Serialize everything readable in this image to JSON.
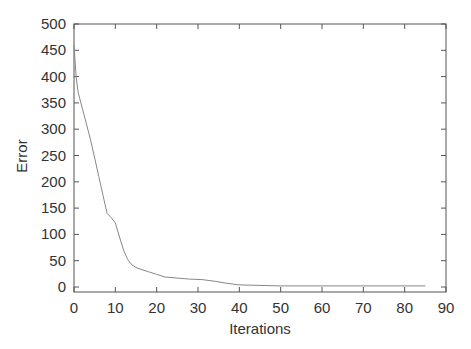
{
  "chart_data": {
    "type": "line",
    "title": "",
    "xlabel": "Iterations",
    "ylabel": "Error",
    "xlim": [
      0,
      90
    ],
    "ylim": [
      0,
      500
    ],
    "xticks": [
      0,
      10,
      20,
      30,
      40,
      50,
      60,
      70,
      80,
      90
    ],
    "yticks": [
      0,
      50,
      100,
      150,
      200,
      250,
      300,
      350,
      400,
      450,
      500
    ],
    "grid": false,
    "legend": null,
    "series": [
      {
        "name": "Error",
        "color": "#888888",
        "x": [
          0,
          0.5,
          1,
          2,
          3,
          4,
          5,
          6,
          7,
          8,
          9,
          10,
          11,
          12,
          13,
          14,
          15,
          16,
          18,
          20,
          22,
          25,
          28,
          31,
          34,
          37,
          40,
          45,
          50,
          60,
          70,
          80,
          85
        ],
        "y": [
          460,
          400,
          370,
          340,
          310,
          280,
          245,
          210,
          175,
          140,
          132,
          122,
          95,
          70,
          52,
          42,
          37,
          34,
          29,
          24,
          19,
          17,
          15,
          14,
          11,
          7,
          4,
          3,
          2,
          2,
          2,
          2,
          2
        ]
      }
    ]
  }
}
